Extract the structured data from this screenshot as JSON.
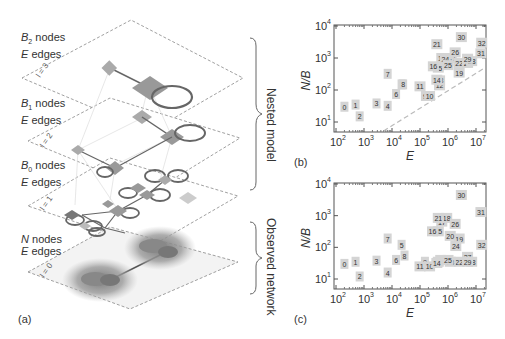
{
  "panel_a": {
    "tag": "(a)",
    "layers": [
      {
        "level": "l = 3",
        "label_var": "B",
        "label_sub": "2",
        "label_rest": " nodes",
        "edges_var": "E",
        "edges_rest": " edges"
      },
      {
        "level": "l = 2",
        "label_var": "B",
        "label_sub": "1",
        "label_rest": " nodes",
        "edges_var": "E",
        "edges_rest": " edges"
      },
      {
        "level": "l = 1",
        "label_var": "B",
        "label_sub": "0",
        "label_rest": " nodes",
        "edges_var": "E",
        "edges_rest": " edges"
      },
      {
        "level": "l = 0",
        "label_var": "N",
        "label_sub": "",
        "label_rest": " nodes",
        "edges_var": "E",
        "edges_rest": " edges"
      }
    ],
    "brace_top": "Nested model",
    "brace_bottom": "Observed network"
  },
  "chart_data": [
    {
      "type": "scatter",
      "panel": "(b)",
      "xlabel": "E",
      "ylabel": "N/B",
      "xscale": "log",
      "yscale": "log",
      "xlim": [
        100,
        30000000
      ],
      "ylim": [
        5,
        10000
      ],
      "xticks": [
        "10^2",
        "10^3",
        "10^4",
        "10^5",
        "10^6",
        "10^7"
      ],
      "yticks": [
        "10^1",
        "10^2",
        "10^3",
        "10^4"
      ],
      "reference_line": "dashed diagonal",
      "points": [
        {
          "id": "0",
          "x": 200,
          "y": 30
        },
        {
          "id": "1",
          "x": 500,
          "y": 35
        },
        {
          "id": "2",
          "x": 700,
          "y": 15
        },
        {
          "id": "3",
          "x": 2800,
          "y": 38
        },
        {
          "id": "4",
          "x": 7000,
          "y": 32
        },
        {
          "id": "5",
          "x": 22000,
          "y": 150
        },
        {
          "id": "6",
          "x": 14000,
          "y": 75
        },
        {
          "id": "7",
          "x": 7000,
          "y": 320
        },
        {
          "id": "8",
          "x": 25000,
          "y": 150
        },
        {
          "id": "9",
          "x": 150000,
          "y": 65
        },
        {
          "id": "10",
          "x": 220000,
          "y": 65
        },
        {
          "id": "11",
          "x": 100000,
          "y": 130
        },
        {
          "id": "12",
          "x": 500000,
          "y": 140
        },
        {
          "id": "13",
          "x": 500000,
          "y": 200
        },
        {
          "id": "14",
          "x": 400000,
          "y": 210
        },
        {
          "id": "15",
          "x": 450000,
          "y": 500
        },
        {
          "id": "16",
          "x": 300000,
          "y": 550
        },
        {
          "id": "17",
          "x": 600000,
          "y": 1000
        },
        {
          "id": "18",
          "x": 900000,
          "y": 1000
        },
        {
          "id": "19",
          "x": 2500000,
          "y": 350
        },
        {
          "id": "20",
          "x": 1300000,
          "y": 1000
        },
        {
          "id": "21",
          "x": 400000,
          "y": 2700
        },
        {
          "id": "22",
          "x": 2500000,
          "y": 700
        },
        {
          "id": "23",
          "x": 1000000,
          "y": 800
        },
        {
          "id": "24",
          "x": 800000,
          "y": 900
        },
        {
          "id": "25",
          "x": 1000000,
          "y": 600
        },
        {
          "id": "26",
          "x": 1800000,
          "y": 1500
        },
        {
          "id": "27",
          "x": 5000000,
          "y": 700
        },
        {
          "id": "28",
          "x": 7000000,
          "y": 800
        },
        {
          "id": "29",
          "x": 5000000,
          "y": 950
        },
        {
          "id": "30",
          "x": 3000000,
          "y": 4500
        },
        {
          "id": "31",
          "x": 15000000,
          "y": 1400
        },
        {
          "id": "32",
          "x": 16000000,
          "y": 3000
        }
      ]
    },
    {
      "type": "scatter",
      "panel": "(c)",
      "xlabel": "E",
      "ylabel": "N/B",
      "xscale": "log",
      "yscale": "log",
      "xlim": [
        100,
        30000000
      ],
      "ylim": [
        5,
        10000
      ],
      "xticks": [
        "10^2",
        "10^3",
        "10^4",
        "10^5",
        "10^6",
        "10^7"
      ],
      "yticks": [
        "10^1",
        "10^2",
        "10^3",
        "10^4"
      ],
      "points": [
        {
          "id": "0",
          "x": 200,
          "y": 30
        },
        {
          "id": "1",
          "x": 500,
          "y": 35
        },
        {
          "id": "2",
          "x": 700,
          "y": 12
        },
        {
          "id": "3",
          "x": 2800,
          "y": 38
        },
        {
          "id": "4",
          "x": 7000,
          "y": 16
        },
        {
          "id": "5",
          "x": 22000,
          "y": 120
        },
        {
          "id": "6",
          "x": 14000,
          "y": 40
        },
        {
          "id": "7",
          "x": 7000,
          "y": 190
        },
        {
          "id": "8",
          "x": 28000,
          "y": 55
        },
        {
          "id": "9",
          "x": 150000,
          "y": 35
        },
        {
          "id": "10",
          "x": 220000,
          "y": 25
        },
        {
          "id": "11",
          "x": 100000,
          "y": 25
        },
        {
          "id": "12",
          "x": 550000,
          "y": 40
        },
        {
          "id": "13",
          "x": 450000,
          "y": 35
        },
        {
          "id": "14",
          "x": 400000,
          "y": 32
        },
        {
          "id": "15",
          "x": 450000,
          "y": 320
        },
        {
          "id": "16",
          "x": 280000,
          "y": 320
        },
        {
          "id": "17",
          "x": 600000,
          "y": 650
        },
        {
          "id": "18",
          "x": 900000,
          "y": 850
        },
        {
          "id": "19",
          "x": 2500000,
          "y": 190
        },
        {
          "id": "20",
          "x": 1200000,
          "y": 230
        },
        {
          "id": "21",
          "x": 450000,
          "y": 850
        },
        {
          "id": "22",
          "x": 2500000,
          "y": 35
        },
        {
          "id": "23",
          "x": 1200000,
          "y": 35
        },
        {
          "id": "24",
          "x": 1900000,
          "y": 110
        },
        {
          "id": "25",
          "x": 1000000,
          "y": 40
        },
        {
          "id": "26",
          "x": 1800000,
          "y": 550
        },
        {
          "id": "27",
          "x": 5000000,
          "y": 50
        },
        {
          "id": "28",
          "x": 7000000,
          "y": 35
        },
        {
          "id": "29",
          "x": 5000000,
          "y": 35
        },
        {
          "id": "30",
          "x": 3000000,
          "y": 4500
        },
        {
          "id": "31",
          "x": 15000000,
          "y": 1300
        },
        {
          "id": "32",
          "x": 16000000,
          "y": 120
        }
      ]
    }
  ],
  "panel_b": {
    "tag": "(b)"
  },
  "panel_c": {
    "tag": "(c)"
  }
}
